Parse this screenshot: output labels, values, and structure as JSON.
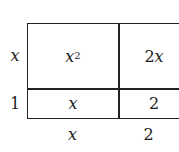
{
  "diagram": {
    "type": "area-model",
    "row_labels": [
      {
        "var": "x"
      },
      {
        "text": "1"
      }
    ],
    "col_labels": [
      {
        "var": "x"
      },
      {
        "text": "2"
      }
    ],
    "cells": [
      {
        "var": "x",
        "sup": "2"
      },
      {
        "coef": "2",
        "var": "x"
      },
      {
        "var": "x"
      },
      {
        "text": "2"
      }
    ]
  }
}
